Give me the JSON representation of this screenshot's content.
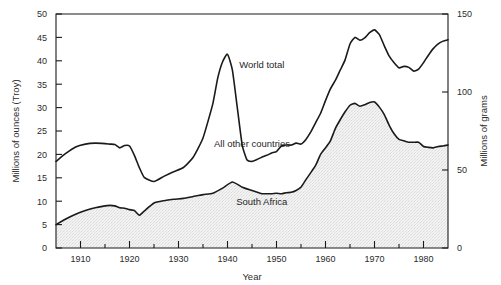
{
  "chart_data": {
    "type": "area",
    "title": "",
    "xlabel": "Year",
    "ylabel": "Millions of ounces (Troy)",
    "ylabel_right": "Millions of grams",
    "xlim": [
      1905,
      1985
    ],
    "ylim": [
      0,
      50
    ],
    "ylim_right": [
      0,
      150
    ],
    "grid": false,
    "legend_position": "inline-annotations",
    "xticks": [
      1910,
      1920,
      1930,
      1940,
      1950,
      1960,
      1970,
      1980
    ],
    "xtick_labels": [
      "1910",
      "1920",
      "1930",
      "1940",
      "1950",
      "1960",
      "1970",
      "1980"
    ],
    "xminorticks": [
      1905,
      1915,
      1925,
      1935,
      1945,
      1955,
      1965,
      1975,
      1985
    ],
    "yticks": [
      0,
      5,
      10,
      15,
      20,
      25,
      30,
      35,
      40,
      45,
      50
    ],
    "ytick_labels": [
      "0",
      "5",
      "10",
      "15",
      "20",
      "25",
      "30",
      "35",
      "40",
      "45",
      "50"
    ],
    "yticks_right": [
      0,
      50,
      100,
      150
    ],
    "ytick_labels_right": [
      "0",
      "50",
      "100",
      "150"
    ],
    "annotations": [
      {
        "text": "World total",
        "x": 1947,
        "y": 38.5
      },
      {
        "text": "All other countries",
        "x": 1945,
        "y": 21.5
      },
      {
        "text": "South Africa",
        "x": 1947,
        "y": 9.2
      }
    ],
    "series": [
      {
        "name": "World total",
        "style": "line",
        "color": "#1a1a1a",
        "x": [
          1905,
          1907,
          1909,
          1911,
          1913,
          1915,
          1916,
          1917,
          1918,
          1919,
          1920,
          1921,
          1922,
          1923,
          1925,
          1927,
          1929,
          1931,
          1933,
          1935,
          1937,
          1938,
          1939,
          1940,
          1941,
          1942,
          1943,
          1944,
          1945,
          1946,
          1947,
          1948,
          1949,
          1950,
          1951,
          1952,
          1953,
          1954,
          1955,
          1956,
          1957,
          1958,
          1959,
          1960,
          1961,
          1962,
          1963,
          1964,
          1965,
          1966,
          1967,
          1968,
          1969,
          1970,
          1971,
          1972,
          1973,
          1974,
          1975,
          1976,
          1977,
          1978,
          1979,
          1980,
          1981,
          1982,
          1983,
          1984,
          1985
        ],
        "values": [
          18.5,
          20.2,
          21.6,
          22.2,
          22.4,
          22.3,
          22.2,
          22.1,
          21.4,
          21.9,
          21.8,
          19.8,
          17.2,
          15.1,
          14.2,
          15.3,
          16.3,
          17.2,
          19.4,
          23.5,
          30.8,
          36.3,
          39.8,
          41.4,
          38.0,
          30.0,
          22.0,
          18.8,
          18.5,
          18.9,
          19.4,
          19.8,
          20.3,
          20.6,
          21.8,
          22.0,
          22.0,
          22.4,
          22.2,
          23.2,
          24.8,
          26.8,
          28.8,
          31.5,
          34.0,
          35.8,
          38.0,
          40.2,
          43.6,
          45.0,
          44.4,
          44.9,
          46.0,
          46.6,
          45.6,
          43.2,
          41.0,
          39.6,
          38.5,
          38.8,
          38.6,
          37.8,
          38.2,
          39.6,
          41.2,
          42.6,
          43.6,
          44.2,
          44.5
        ]
      },
      {
        "name": "South Africa",
        "style": "area-filled-gray",
        "color": "#1a1a1a",
        "fill": "#e3e3e3",
        "x": [
          1905,
          1907,
          1909,
          1911,
          1913,
          1915,
          1916,
          1917,
          1918,
          1919,
          1920,
          1921,
          1922,
          1923,
          1925,
          1927,
          1929,
          1931,
          1933,
          1935,
          1937,
          1939,
          1941,
          1943,
          1945,
          1947,
          1948,
          1949,
          1950,
          1951,
          1952,
          1953,
          1954,
          1955,
          1956,
          1957,
          1958,
          1959,
          1960,
          1961,
          1962,
          1963,
          1964,
          1965,
          1966,
          1967,
          1968,
          1969,
          1970,
          1971,
          1972,
          1973,
          1974,
          1975,
          1976,
          1977,
          1978,
          1979,
          1980,
          1981,
          1982,
          1983,
          1984,
          1985
        ],
        "values": [
          5.0,
          6.2,
          7.2,
          8.0,
          8.6,
          9.0,
          9.1,
          9.0,
          8.6,
          8.5,
          8.2,
          8.0,
          7.0,
          7.9,
          9.6,
          10.1,
          10.4,
          10.6,
          11.0,
          11.4,
          11.7,
          12.8,
          14.1,
          13.0,
          12.3,
          11.6,
          11.6,
          11.6,
          11.7,
          11.6,
          11.8,
          11.9,
          12.3,
          13.0,
          14.6,
          16.1,
          17.7,
          20.0,
          21.4,
          22.9,
          25.5,
          27.4,
          29.1,
          30.5,
          30.9,
          30.3,
          30.6,
          31.1,
          31.2,
          30.1,
          28.5,
          26.2,
          24.4,
          23.2,
          22.9,
          22.6,
          22.6,
          22.6,
          21.7,
          21.5,
          21.4,
          21.7,
          21.8,
          22.0
        ]
      }
    ]
  },
  "axis": {
    "left_title": "Millions of ounces (Troy)",
    "right_title": "Millions of grams",
    "bottom_title": "Year"
  }
}
